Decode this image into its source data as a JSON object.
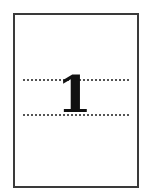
{
  "page_icon": {
    "numeral": "1",
    "border_color": "#3a3a3a",
    "guide_color": "#555555",
    "text_color": "#111111"
  }
}
